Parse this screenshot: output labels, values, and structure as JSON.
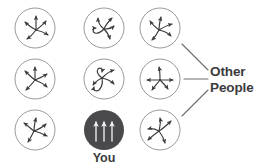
{
  "diagram": {
    "title": "",
    "background_color": "#ffffff",
    "labels": [
      {
        "id": "other-people-line1",
        "text": "Other"
      },
      {
        "id": "other-people-line2",
        "text": "People"
      },
      {
        "id": "you",
        "text": "You"
      }
    ],
    "label_color": "#3b3b3d",
    "circle_outline_color": "#9a9a9c",
    "arrow_color": "#3b3b3d",
    "highlight_fill_color": "#4a4a4c",
    "highlight_arrow_color": "#f2f2f2",
    "connector_color": "#6e6e70",
    "grid": {
      "rows": 3,
      "columns": 3,
      "radius": 20
    },
    "nodes": [
      {
        "id": "node-r1c1",
        "row": 1,
        "col": 1,
        "cx": 35,
        "cy": 28,
        "state": "disordered",
        "highlighted": false
      },
      {
        "id": "node-r1c2",
        "row": 1,
        "col": 2,
        "cx": 104,
        "cy": 28,
        "state": "disordered",
        "highlighted": false
      },
      {
        "id": "node-r1c3",
        "row": 1,
        "col": 3,
        "cx": 160,
        "cy": 28,
        "state": "disordered",
        "highlighted": false
      },
      {
        "id": "node-r2c1",
        "row": 2,
        "col": 1,
        "cx": 35,
        "cy": 79,
        "state": "disordered",
        "highlighted": false
      },
      {
        "id": "node-r2c2",
        "row": 2,
        "col": 2,
        "cx": 104,
        "cy": 79,
        "state": "disordered",
        "highlighted": false
      },
      {
        "id": "node-r2c3",
        "row": 2,
        "col": 3,
        "cx": 160,
        "cy": 79,
        "state": "disordered",
        "highlighted": false
      },
      {
        "id": "node-r3c1",
        "row": 3,
        "col": 1,
        "cx": 35,
        "cy": 130,
        "state": "disordered",
        "highlighted": false
      },
      {
        "id": "node-you",
        "row": 3,
        "col": 2,
        "cx": 104,
        "cy": 130,
        "state": "aligned",
        "highlighted": true
      },
      {
        "id": "node-r3c3",
        "row": 3,
        "col": 3,
        "cx": 160,
        "cy": 130,
        "state": "disordered",
        "highlighted": false
      }
    ],
    "connectors": [
      {
        "id": "connector-top",
        "from": "node-r1c3",
        "to": "other-people",
        "x1": 182,
        "y1": 44,
        "x2": 208,
        "y2": 70
      },
      {
        "id": "connector-middle",
        "from": "node-r2c3",
        "to": "other-people",
        "x1": 184,
        "y1": 79,
        "x2": 208,
        "y2": 79
      },
      {
        "id": "connector-bottom",
        "from": "node-r3c3",
        "to": "other-people",
        "x1": 182,
        "y1": 116,
        "x2": 208,
        "y2": 90
      }
    ]
  }
}
